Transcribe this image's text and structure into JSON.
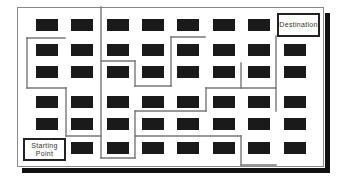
{
  "diagram": {
    "type": "route-map",
    "labels": {
      "start": "Starting Point",
      "start_line1": "Starting",
      "start_line2": "Point",
      "destination": "Destination"
    },
    "colors": {
      "block": "#1a1a1a",
      "route": "#777777",
      "frame": "#888888",
      "shadow": "#111111",
      "label_border": "#222222"
    },
    "grid": {
      "columns": [
        36,
        71,
        107,
        142,
        177,
        213,
        248,
        284
      ],
      "rows": [
        19,
        44,
        66,
        96,
        118,
        142
      ],
      "block_width": 22,
      "block_height": 12,
      "omitted_cells": [
        [
          0,
          7
        ],
        [
          5,
          0
        ]
      ]
    },
    "route_segments": [
      [
        [
          27,
          38
        ],
        [
          65,
          38
        ]
      ],
      [
        [
          27,
          38
        ],
        [
          27,
          88
        ]
      ],
      [
        [
          27,
          88
        ],
        [
          66,
          88
        ]
      ],
      [
        [
          66,
          88
        ],
        [
          66,
          136
        ]
      ],
      [
        [
          66,
          136
        ],
        [
          101,
          136
        ]
      ],
      [
        [
          101,
          7
        ],
        [
          101,
          158
        ]
      ],
      [
        [
          101,
          61
        ],
        [
          135,
          61
        ]
      ],
      [
        [
          135,
          61
        ],
        [
          135,
          86
        ]
      ],
      [
        [
          135,
          86
        ],
        [
          171,
          86
        ]
      ],
      [
        [
          171,
          37
        ],
        [
          171,
          86
        ]
      ],
      [
        [
          171,
          37
        ],
        [
          205,
          37
        ]
      ],
      [
        [
          101,
          158
        ],
        [
          135,
          158
        ]
      ],
      [
        [
          135,
          111
        ],
        [
          135,
          158
        ]
      ],
      [
        [
          135,
          111
        ],
        [
          206,
          111
        ]
      ],
      [
        [
          206,
          88
        ],
        [
          206,
          111
        ]
      ],
      [
        [
          206,
          88
        ],
        [
          276,
          88
        ]
      ],
      [
        [
          241,
          63
        ],
        [
          241,
          88
        ]
      ],
      [
        [
          276,
          36
        ],
        [
          276,
          111
        ]
      ],
      [
        [
          135,
          136
        ],
        [
          241,
          136
        ]
      ],
      [
        [
          241,
          136
        ],
        [
          241,
          165
        ]
      ],
      [
        [
          241,
          165
        ],
        [
          276,
          165
        ]
      ]
    ]
  }
}
